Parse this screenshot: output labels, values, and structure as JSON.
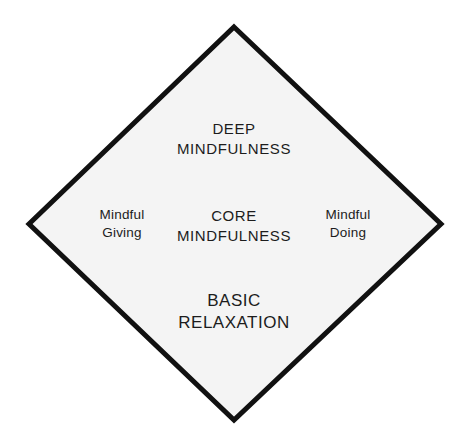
{
  "diagram": {
    "name": "mindfulness-diamond",
    "shape": "diamond",
    "background_color": "#ffffff",
    "fill_color": "#f4f4f4",
    "stroke_color": "#111111",
    "stroke_width": 5,
    "text_color": "#1c1c1c",
    "vertices": {
      "top": {
        "x": 234,
        "y": 27
      },
      "right": {
        "x": 441,
        "y": 224
      },
      "bottom": {
        "x": 234,
        "y": 420
      },
      "left": {
        "x": 29,
        "y": 224
      }
    },
    "labels": {
      "top": {
        "id": "deep-mindfulness",
        "lines": [
          "DEEP",
          "MINDFULNESS"
        ]
      },
      "center": {
        "id": "core-mindfulness",
        "lines": [
          "CORE",
          "MINDFULNESS"
        ]
      },
      "bottom": {
        "id": "basic-relaxation",
        "lines": [
          "BASIC",
          "RELAXATION"
        ]
      },
      "left": {
        "id": "mindful-giving",
        "lines": [
          "Mindful",
          "Giving"
        ]
      },
      "right": {
        "id": "mindful-doing",
        "lines": [
          "Mindful",
          "Doing"
        ]
      }
    }
  }
}
